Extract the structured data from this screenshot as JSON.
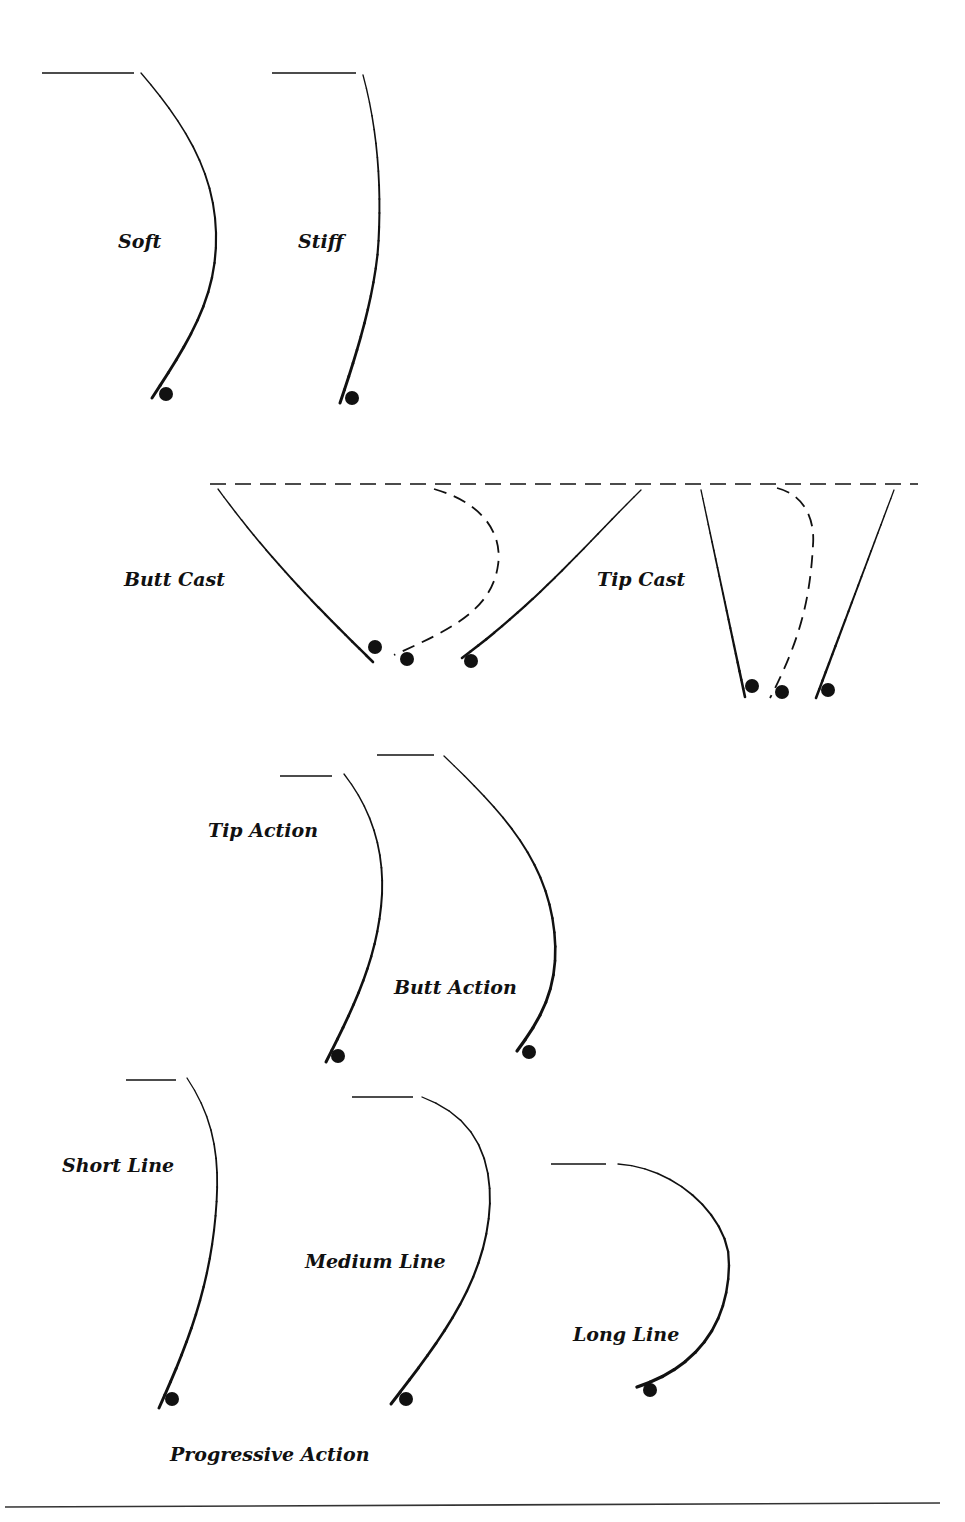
{
  "colors": {
    "ink": "#111111",
    "background": "#ffffff"
  },
  "labels": [
    {
      "id": "soft",
      "text": "Soft",
      "x": 118,
      "y": 232
    },
    {
      "id": "stiff",
      "text": "Stiff",
      "x": 298,
      "y": 232
    },
    {
      "id": "butt-cast",
      "text": "Butt Cast",
      "x": 124,
      "y": 570
    },
    {
      "id": "tip-cast",
      "text": "Tip Cast",
      "x": 597,
      "y": 570
    },
    {
      "id": "tip-action",
      "text": "Tip Action",
      "x": 208,
      "y": 821
    },
    {
      "id": "butt-action",
      "text": "Butt Action",
      "x": 394,
      "y": 978
    },
    {
      "id": "short-line",
      "text": "Short Line",
      "x": 62,
      "y": 1156
    },
    {
      "id": "medium-line",
      "text": "Medium Line",
      "x": 305,
      "y": 1252
    },
    {
      "id": "long-line",
      "text": "Long Line",
      "x": 573,
      "y": 1325
    },
    {
      "id": "progressive-action",
      "text": "Progressive Action",
      "x": 170,
      "y": 1445
    }
  ],
  "rods": [
    {
      "id": "soft-rod",
      "line": [
        [
          42,
          73
        ],
        [
          134,
          73
        ]
      ],
      "path": "M141,73 C190,130 218,180 216,245 C214,300 190,340 152,398",
      "width_top": 1.3,
      "width_bottom": 3,
      "reel": [
        166,
        394
      ]
    },
    {
      "id": "stiff-rod",
      "line": [
        [
          272,
          73
        ],
        [
          356,
          73
        ]
      ],
      "path": "M363,75 C378,130 382,190 378,250 C373,300 358,350 340,403",
      "width_top": 1.3,
      "width_bottom": 3,
      "reel": [
        352,
        398
      ]
    },
    {
      "id": "tip-action-rod",
      "line": [
        [
          280,
          776
        ],
        [
          332,
          776
        ]
      ],
      "path": "M344,774 C372,810 384,850 382,895 C378,960 352,1010 326,1062",
      "width_top": 1.3,
      "width_bottom": 3,
      "reel": [
        338,
        1056
      ]
    },
    {
      "id": "butt-action-rod",
      "line": [
        [
          377,
          755
        ],
        [
          434,
          755
        ]
      ],
      "path": "M444,756 C500,810 550,860 555,940 C558,990 540,1020 517,1051",
      "width_top": 1.3,
      "width_bottom": 3.2,
      "reel": [
        529,
        1052
      ]
    },
    {
      "id": "short-line-rod",
      "line": [
        [
          126,
          1080
        ],
        [
          176,
          1080
        ]
      ],
      "path": "M187,1078 C215,1120 220,1160 216,1210 C210,1290 185,1350 159,1408",
      "width_top": 1.3,
      "width_bottom": 3,
      "reel": [
        172,
        1399
      ]
    },
    {
      "id": "medium-line-rod",
      "line": [
        [
          352,
          1097
        ],
        [
          413,
          1097
        ]
      ],
      "path": "M422,1097 C470,1115 490,1150 490,1200 C488,1280 440,1340 391,1404",
      "width_top": 1.3,
      "width_bottom": 3,
      "reel": [
        406,
        1399
      ]
    },
    {
      "id": "long-line-rod",
      "line": [
        [
          551,
          1164
        ],
        [
          606,
          1164
        ]
      ],
      "path": "M618,1164 C680,1168 728,1220 729,1260 C730,1330 690,1370 637,1387",
      "width_top": 1.3,
      "width_bottom": 3.4,
      "reel": [
        650,
        1390
      ]
    }
  ],
  "casts": {
    "dashed_baseline": [
      [
        210,
        484
      ],
      [
        918,
        484
      ]
    ],
    "butt_cast": {
      "solid_left": "M218,489 C270,560 320,610 373,662",
      "dashed_mid": "M434,489 C490,505 502,540 498,565 C492,610 450,630 394,655",
      "solid_right": "M641,490 C590,540 540,600 462,658",
      "reels": [
        [
          375,
          647
        ],
        [
          407,
          659
        ],
        [
          471,
          661
        ]
      ]
    },
    "tip_cast": {
      "solid_left": "M701,490 L745,697",
      "dashed_mid": "M777,488 C805,495 815,520 813,545 C810,600 800,640 770,698",
      "solid_right": "M894,490 L816,698",
      "reels": [
        [
          752,
          686
        ],
        [
          782,
          692
        ],
        [
          828,
          690
        ]
      ]
    }
  },
  "footer_rule": [
    [
      5,
      1507
    ],
    [
      940,
      1503
    ]
  ]
}
